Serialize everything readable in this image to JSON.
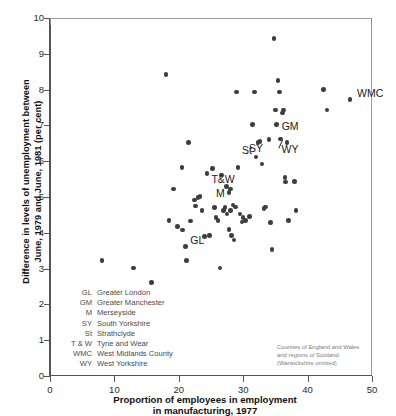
{
  "chart_data": {
    "type": "scatter",
    "title": "",
    "xlabel": "Proportion of employees in employment in manufacturing, 1977",
    "xlabel_lines": [
      "Proportion of employees in employment",
      "in manufacturing, 1977"
    ],
    "ylabel": "Difference in levels of unemployment between June, 1979 and June, 1981 (per cent)",
    "ylabel_lines": [
      "Difference in levels of unemployment between",
      "June, 1979 and June, 1981 (per cent)"
    ],
    "xlim": [
      0,
      50
    ],
    "ylim": [
      0,
      10
    ],
    "xticks": [
      0,
      10,
      20,
      30,
      40,
      50
    ],
    "yticks": [
      0,
      1,
      2,
      3,
      4,
      5,
      6,
      7,
      8,
      9,
      10
    ],
    "grid": false,
    "legend_position": "none",
    "marker_color": "#3d3d3d",
    "points": [
      {
        "x": 8.1,
        "y": 3.22,
        "label": ""
      },
      {
        "x": 13.0,
        "y": 3.02,
        "label": ""
      },
      {
        "x": 15.8,
        "y": 2.62,
        "label": ""
      },
      {
        "x": 18.0,
        "y": 8.42,
        "label": ""
      },
      {
        "x": 18.5,
        "y": 4.35,
        "label": ""
      },
      {
        "x": 19.2,
        "y": 5.22,
        "label": ""
      },
      {
        "x": 19.8,
        "y": 4.18,
        "label": ""
      },
      {
        "x": 20.5,
        "y": 5.82,
        "label": ""
      },
      {
        "x": 20.6,
        "y": 4.08,
        "label": ""
      },
      {
        "x": 21.0,
        "y": 3.62,
        "label": "GL"
      },
      {
        "x": 21.2,
        "y": 3.22,
        "label": ""
      },
      {
        "x": 21.5,
        "y": 6.52,
        "label": ""
      },
      {
        "x": 21.8,
        "y": 4.33,
        "label": ""
      },
      {
        "x": 22.4,
        "y": 4.92,
        "label": ""
      },
      {
        "x": 22.6,
        "y": 4.75,
        "label": ""
      },
      {
        "x": 23.3,
        "y": 5.02,
        "label": ""
      },
      {
        "x": 23.6,
        "y": 4.62,
        "label": ""
      },
      {
        "x": 24.0,
        "y": 3.9,
        "label": ""
      },
      {
        "x": 24.4,
        "y": 5.65,
        "label": ""
      },
      {
        "x": 24.8,
        "y": 3.92,
        "label": ""
      },
      {
        "x": 25.2,
        "y": 5.8,
        "label": ""
      },
      {
        "x": 25.5,
        "y": 4.7,
        "label": ""
      },
      {
        "x": 25.8,
        "y": 4.42,
        "label": ""
      },
      {
        "x": 26.1,
        "y": 4.35,
        "label": ""
      },
      {
        "x": 26.4,
        "y": 3.02,
        "label": ""
      },
      {
        "x": 26.6,
        "y": 5.62,
        "label": ""
      },
      {
        "x": 26.9,
        "y": 4.62,
        "label": ""
      },
      {
        "x": 27.2,
        "y": 4.7,
        "label": ""
      },
      {
        "x": 27.5,
        "y": 4.52,
        "label": ""
      },
      {
        "x": 27.8,
        "y": 4.1,
        "label": ""
      },
      {
        "x": 28.0,
        "y": 4.62,
        "label": ""
      },
      {
        "x": 28.2,
        "y": 3.92,
        "label": ""
      },
      {
        "x": 28.4,
        "y": 4.78,
        "label": ""
      },
      {
        "x": 28.6,
        "y": 3.8,
        "label": ""
      },
      {
        "x": 28.8,
        "y": 4.72,
        "label": ""
      },
      {
        "x": 29.0,
        "y": 7.93,
        "label": ""
      },
      {
        "x": 29.2,
        "y": 5.82,
        "label": ""
      },
      {
        "x": 29.5,
        "y": 4.52,
        "label": ""
      },
      {
        "x": 30.0,
        "y": 4.42,
        "label": ""
      },
      {
        "x": 30.4,
        "y": 4.35,
        "label": ""
      },
      {
        "x": 31.0,
        "y": 4.45,
        "label": ""
      },
      {
        "x": 31.4,
        "y": 7.02,
        "label": ""
      },
      {
        "x": 31.8,
        "y": 7.93,
        "label": ""
      },
      {
        "x": 32.0,
        "y": 6.12,
        "label": ""
      },
      {
        "x": 32.3,
        "y": 6.52,
        "label": "St"
      },
      {
        "x": 32.6,
        "y": 6.55,
        "label": ""
      },
      {
        "x": 32.9,
        "y": 5.92,
        "label": ""
      },
      {
        "x": 33.2,
        "y": 4.68,
        "label": ""
      },
      {
        "x": 33.5,
        "y": 4.72,
        "label": ""
      },
      {
        "x": 34.0,
        "y": 6.6,
        "label": "SY"
      },
      {
        "x": 34.2,
        "y": 4.28,
        "label": ""
      },
      {
        "x": 34.5,
        "y": 3.53,
        "label": ""
      },
      {
        "x": 34.8,
        "y": 9.42,
        "label": ""
      },
      {
        "x": 35.0,
        "y": 7.43,
        "label": ""
      },
      {
        "x": 35.2,
        "y": 7.02,
        "label": "GM"
      },
      {
        "x": 35.4,
        "y": 8.25,
        "label": ""
      },
      {
        "x": 35.6,
        "y": 7.93,
        "label": ""
      },
      {
        "x": 35.8,
        "y": 6.62,
        "label": "WY"
      },
      {
        "x": 36.1,
        "y": 7.35,
        "label": ""
      },
      {
        "x": 36.3,
        "y": 7.43,
        "label": ""
      },
      {
        "x": 36.5,
        "y": 5.55,
        "label": ""
      },
      {
        "x": 36.6,
        "y": 5.42,
        "label": ""
      },
      {
        "x": 36.8,
        "y": 6.52,
        "label": ""
      },
      {
        "x": 37.0,
        "y": 4.35,
        "label": ""
      },
      {
        "x": 38.0,
        "y": 5.43,
        "label": ""
      },
      {
        "x": 38.2,
        "y": 4.62,
        "label": ""
      },
      {
        "x": 42.5,
        "y": 8.0,
        "label": ""
      },
      {
        "x": 43.0,
        "y": 7.43,
        "label": ""
      },
      {
        "x": 46.6,
        "y": 7.72,
        "label": "WMC"
      },
      {
        "x": 27.4,
        "y": 5.3,
        "label": "T & W"
      },
      {
        "x": 27.8,
        "y": 5.12,
        "label": "M"
      },
      {
        "x": 28.0,
        "y": 5.22,
        "label": ""
      },
      {
        "x": 23.0,
        "y": 4.98,
        "label": ""
      },
      {
        "x": 29.8,
        "y": 4.3,
        "label": ""
      }
    ],
    "annotations": [
      {
        "text": "GL",
        "x": 21.0,
        "y": 3.62
      },
      {
        "text": "GM",
        "x": 35.2,
        "y": 7.02
      },
      {
        "text": "M",
        "x": 27.8,
        "y": 5.12
      },
      {
        "text": "SY",
        "x": 34.0,
        "y": 6.6
      },
      {
        "text": "St",
        "x": 32.3,
        "y": 6.52
      },
      {
        "text": "T&W",
        "x": 27.4,
        "y": 5.3
      },
      {
        "text": "WMC",
        "x": 46.6,
        "y": 7.72
      },
      {
        "text": "WY",
        "x": 35.8,
        "y": 6.62
      }
    ],
    "note_lines": [
      "Counties of England and Wales",
      "and regions of Scotland",
      "(Warwickshire omitted)"
    ]
  },
  "legend": {
    "entries": [
      {
        "abbr": "GL",
        "name": "Greater London"
      },
      {
        "abbr": "GM",
        "name": "Greater Manchester"
      },
      {
        "abbr": "M",
        "name": "Merseyside"
      },
      {
        "abbr": "SY",
        "name": "South Yorkshire"
      },
      {
        "abbr": "St",
        "name": "Strathclyde"
      },
      {
        "abbr": "T & W",
        "name": "Tyne and Wear"
      },
      {
        "abbr": "WMC",
        "name": "West Midlands County"
      },
      {
        "abbr": "WY",
        "name": "West Yorkshire"
      }
    ]
  },
  "axes": {
    "x_title_line1": "Proportion of employees in employment",
    "x_title_line2": "in manufacturing, 1977",
    "y_title_line1": "Difference in levels of unemployment between",
    "y_title_line2": "June, 1979 and June, 1981 (per cent)"
  }
}
